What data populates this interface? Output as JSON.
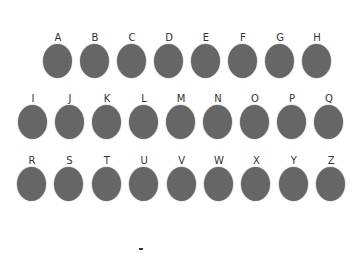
{
  "circle_color": "#666666",
  "rows": [
    {
      "items": [
        "A",
        "B",
        "C",
        "D",
        "E",
        "F",
        "G",
        "H"
      ]
    },
    {
      "items": [
        "I",
        "J",
        "K",
        "L",
        "M",
        "N",
        "O",
        "P",
        "Q"
      ]
    },
    {
      "items": [
        "R",
        "S",
        "T",
        "U",
        "V",
        "W",
        "X",
        "Y",
        "Z"
      ]
    }
  ],
  "footer": {
    "text": "-"
  }
}
